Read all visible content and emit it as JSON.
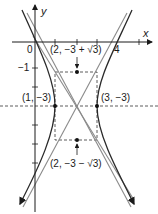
{
  "diagram": {
    "type": "hyperbola-graph",
    "axes": {
      "x_label": "x",
      "y_label": "y"
    },
    "ticks": {
      "origin": "0",
      "x4": "4",
      "y_neg1": "−1"
    },
    "points": [
      {
        "name": "center",
        "label": ""
      },
      {
        "name": "vertex-left",
        "label": "(1, −3)"
      },
      {
        "name": "vertex-right",
        "label": "(3, −3)"
      },
      {
        "name": "focus-top",
        "label": "(2, −3 + √3)"
      },
      {
        "name": "focus-bottom",
        "label": "(2, −3 − √3)"
      }
    ],
    "colors": {
      "curve": "#2a2a2a",
      "asymptote": "#8a8a8a",
      "axis": "#1a1a1a",
      "dashed": "#333333"
    }
  }
}
